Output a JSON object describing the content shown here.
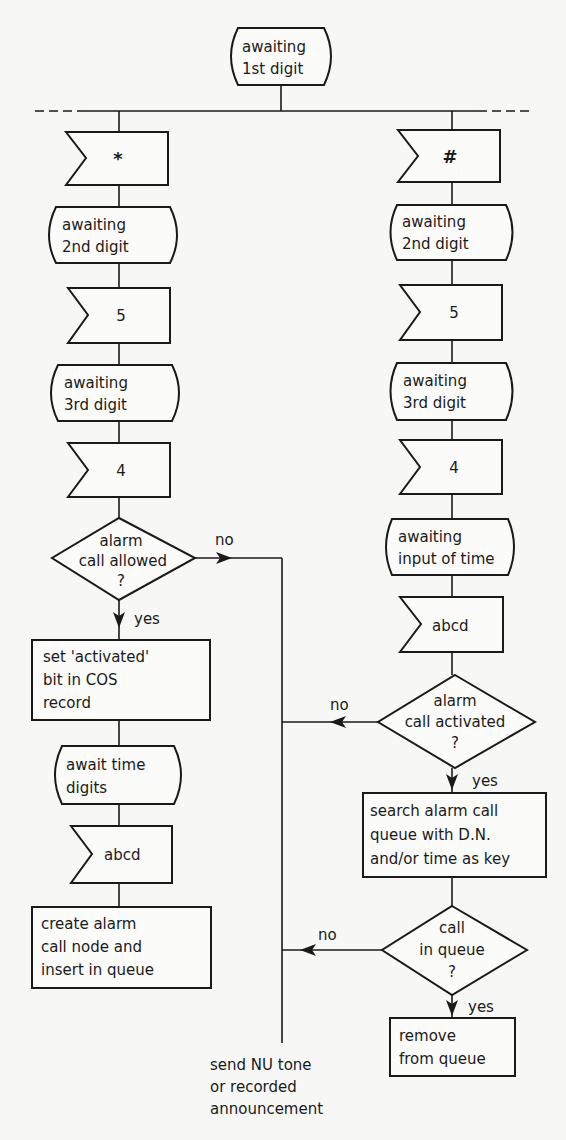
{
  "diagram": {
    "type": "SDL flowchart",
    "start_state": {
      "lines": [
        "awaiting",
        "1st digit"
      ]
    },
    "left_branch": {
      "signal_1": "*",
      "state_2": {
        "lines": [
          "awaiting",
          "2nd digit"
        ]
      },
      "signal_2": "5",
      "state_3": {
        "lines": [
          "awaiting",
          "3rd digit"
        ]
      },
      "signal_3": "4",
      "decision": {
        "lines": [
          "alarm",
          "call allowed",
          "?"
        ],
        "yes": "yes",
        "no": "no"
      },
      "process_1": {
        "lines": [
          "set 'activated'",
          "bit in COS",
          "record"
        ]
      },
      "state_4": {
        "lines": [
          "await time",
          "digits"
        ]
      },
      "signal_4": "abcd",
      "process_2": {
        "lines": [
          "create alarm",
          "call node and",
          "insert in queue"
        ]
      }
    },
    "right_branch": {
      "signal_1": "#",
      "state_2": {
        "lines": [
          "awaiting",
          "2nd digit"
        ]
      },
      "signal_2": "5",
      "state_3": {
        "lines": [
          "awaiting",
          "3rd digit"
        ]
      },
      "signal_3": "4",
      "state_4": {
        "lines": [
          "awaiting",
          "input of time"
        ]
      },
      "signal_4": "abcd",
      "decision_1": {
        "lines": [
          "alarm",
          "call activated",
          "?"
        ],
        "yes": "yes",
        "no": "no"
      },
      "process_1": {
        "lines": [
          "search alarm call",
          "queue with  D.N.",
          "and/or time as key"
        ]
      },
      "decision_2": {
        "lines": [
          "call",
          "in queue",
          "?"
        ],
        "yes": "yes",
        "no": "no"
      },
      "process_2": {
        "lines": [
          "remove",
          "from queue"
        ]
      }
    },
    "error_output": {
      "lines": [
        "send NU tone",
        "or recorded",
        "announcement"
      ]
    }
  }
}
